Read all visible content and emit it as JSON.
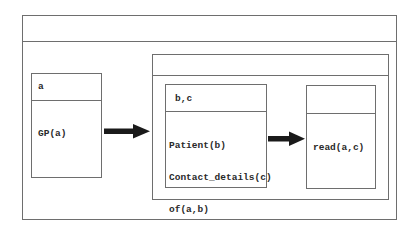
{
  "diagram": {
    "type": "nested-drs",
    "outer_box": {
      "header": "",
      "left_box": {
        "referents": "a",
        "conditions": [
          "GP(a)"
        ]
      },
      "implication_1": "arrow-right",
      "consequent_container": {
        "header": "",
        "antecedent_box": {
          "referents": "b,c",
          "conditions": [
            "Patient(b)",
            "Contact_details(c)",
            "of(a,b)",
            "of(b,c)"
          ]
        },
        "implication_2": "arrow-right",
        "consequent_box": {
          "referents": "",
          "conditions": [
            "read(a,c)"
          ]
        }
      }
    },
    "colors": {
      "border": "#6e6e6e",
      "arrow": "#1a1a1a",
      "text": "#2a2a2a",
      "background": "#ffffff"
    }
  }
}
